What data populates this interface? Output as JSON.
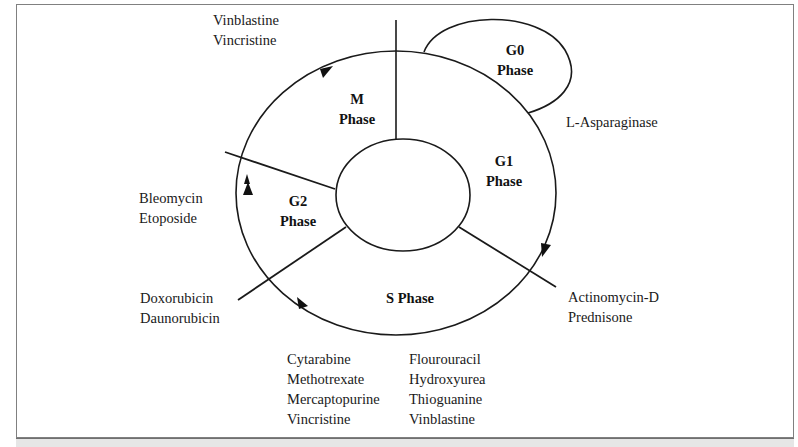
{
  "diagram": {
    "phases": {
      "m": {
        "line1": "M",
        "line2": "Phase"
      },
      "g0": {
        "line1": "G0",
        "line2": "Phase"
      },
      "g1": {
        "line1": "G1",
        "line2": "Phase"
      },
      "g2": {
        "line1": "G2",
        "line2": "Phase"
      },
      "s": {
        "line1": "S Phase"
      }
    },
    "drugs": {
      "m_phase": [
        "Vinblastine",
        "Vincristine"
      ],
      "g0_g1": [
        "L-Asparaginase"
      ],
      "g2_phase": [
        "Bleomycin",
        "Etoposide"
      ],
      "g2_s_boundary": [
        "Doxorubicin",
        "Daunorubicin"
      ],
      "g1_s_boundary": [
        "Actinomycin-D",
        "Prednisone"
      ],
      "s_phase_col1": [
        "Cytarabine",
        "Methotrexate",
        "Mercaptopurine",
        "Vincristine"
      ],
      "s_phase_col2": [
        "Flourouracil",
        "Hydroxyurea",
        "Thioguanine",
        "Vinblastine"
      ]
    },
    "colors": {
      "stroke": "#1a1a1a",
      "frame": "#808080",
      "caption_bar": "#e6e6e6"
    }
  }
}
